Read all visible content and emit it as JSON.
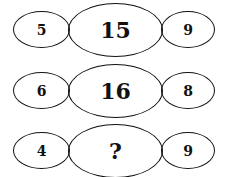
{
  "puzzle": {
    "type": "number-pattern",
    "rows": [
      {
        "left": "5",
        "center": "15",
        "right": "9"
      },
      {
        "left": "6",
        "center": "16",
        "right": "8"
      },
      {
        "left": "4",
        "center": "?",
        "right": "9"
      }
    ],
    "colors": {
      "stroke": "#111111",
      "text": "#111111",
      "background": "#ffffff"
    }
  }
}
